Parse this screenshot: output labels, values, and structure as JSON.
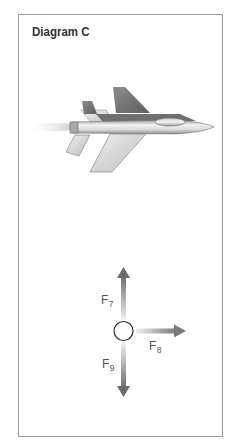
{
  "diagram": {
    "title": "Diagram C",
    "force_diagram": {
      "forces": [
        {
          "id": "F7",
          "letter": "F",
          "subscript": "7",
          "direction": "up"
        },
        {
          "id": "F8",
          "letter": "F",
          "subscript": "8",
          "direction": "right"
        },
        {
          "id": "F9",
          "letter": "F",
          "subscript": "9",
          "direction": "down"
        }
      ]
    }
  },
  "colors": {
    "frame": "#9a9a9a",
    "arrow_dark": "#7a7a7a",
    "arrow_light": "#e6e6e6",
    "text": "#333333"
  }
}
